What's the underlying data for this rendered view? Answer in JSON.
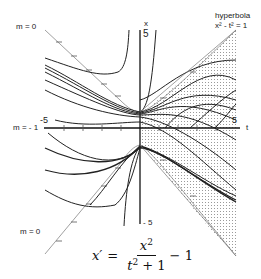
{
  "diagram": {
    "axes": {
      "horizontal_label": "t",
      "vertical_label": "x",
      "tick_labels": {
        "t_min": "-5",
        "t_max": "5",
        "x_max": "5",
        "x_min": "- 5"
      },
      "t_range": [
        -5,
        5
      ],
      "x_range": [
        -5,
        5
      ]
    },
    "isocline_labels": {
      "upper_left": "m = 0",
      "middle_left": "m = - 1",
      "lower_left": "m = 0"
    },
    "hyperbola_label": {
      "line1": "hyperbola",
      "line2": "x² - t² = 1"
    },
    "shaded_region": "region between branches of hyperbola for t > 0 (dotted)",
    "colors": {
      "curves": "#222222",
      "isoclines": "#888888",
      "shading_dots": "#9a9a9a",
      "background": "#ffffff"
    }
  },
  "equation": {
    "lhs": "x′",
    "equals": "=",
    "numerator": "x",
    "numerator_exp": "2",
    "denominator_t": "t",
    "denominator_exp": "2",
    "denominator_rest": " + 1",
    "rhs_tail": " − 1"
  }
}
